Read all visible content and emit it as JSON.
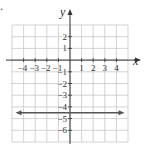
{
  "chart_data": {
    "type": "line",
    "title": "",
    "xlabel": "x",
    "ylabel": "y",
    "xlim": [
      -5,
      5
    ],
    "ylim": [
      -7,
      3
    ],
    "grid": true,
    "x_ticks": [
      "−4",
      "−3",
      "−2",
      "−1",
      "1",
      "2",
      "3",
      "4"
    ],
    "x_tick_values": [
      -4,
      -3,
      -2,
      -1,
      1,
      2,
      3,
      4
    ],
    "y_ticks": [
      "2",
      "1",
      "−1",
      "−2",
      "−3",
      "−4",
      "−5",
      "−6"
    ],
    "y_tick_values": [
      2,
      1,
      -1,
      -2,
      -3,
      -4,
      -5,
      -6
    ],
    "series": [
      {
        "name": "y = -4.5",
        "type": "horizontal-line",
        "y": -4.5,
        "x": [
          -4.7,
          4.7
        ],
        "arrows": "both"
      }
    ],
    "legend": null
  },
  "colors": {
    "grid": "#c8c8c8",
    "axis": "#333333",
    "line": "#555555",
    "text": "#333333"
  },
  "labels": {
    "x_axis": "x",
    "y_axis": "y",
    "marker": "."
  }
}
